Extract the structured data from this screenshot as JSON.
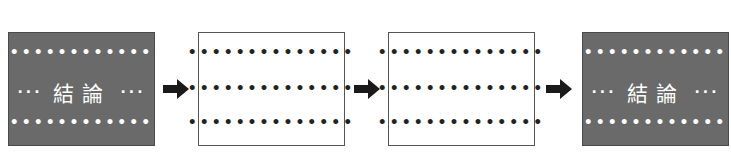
{
  "diagram": {
    "boxes": [
      {
        "style": "dark",
        "top_dots": "••••••••••••••",
        "middle_left": "···",
        "label": "結論",
        "middle_right": "···",
        "bottom_dots": "••••••••••••••"
      },
      {
        "style": "light",
        "rows": [
          "••••••••••••••",
          "••••••••••••••",
          "••••••••••••••"
        ]
      },
      {
        "style": "light",
        "rows": [
          "••••••••••••••",
          "••••••••••••••",
          "••••••••••••••"
        ]
      },
      {
        "style": "dark",
        "top_dots": "••••••••••••••",
        "middle_left": "···",
        "label": "結論",
        "middle_right": "···",
        "bottom_dots": "••••••••••••••"
      }
    ],
    "arrows": [
      "right-arrow",
      "right-arrow",
      "right-arrow"
    ],
    "colors": {
      "dark_fill": "#6a6a6a",
      "arrow": "#1a1a1a",
      "border": "#555555"
    }
  }
}
